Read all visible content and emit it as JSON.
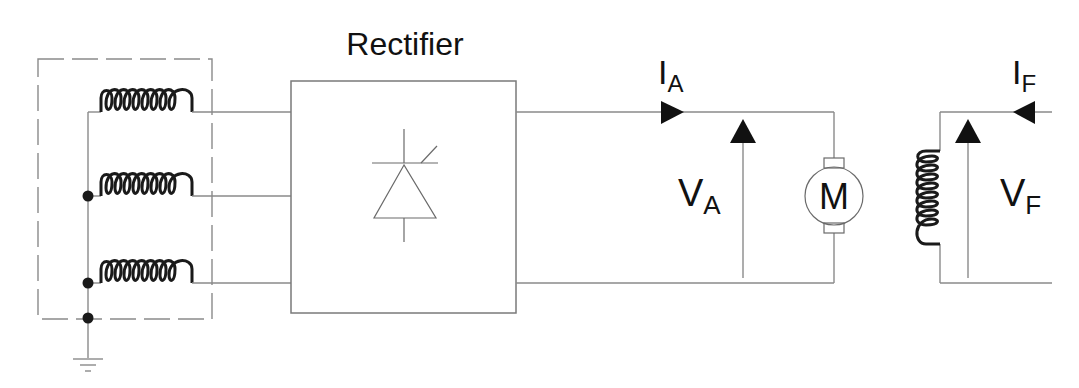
{
  "diagram": {
    "title": "Rectifier",
    "blocks": {
      "rectifier": {
        "label": "Rectifier",
        "symbol": "thyristor"
      },
      "motor": {
        "label": "M"
      }
    },
    "labels": {
      "armature_current": {
        "main": "I",
        "sub": "A"
      },
      "armature_voltage": {
        "main": "V",
        "sub": "A"
      },
      "field_current": {
        "main": "I",
        "sub": "F"
      },
      "field_voltage": {
        "main": "V",
        "sub": "F"
      }
    },
    "components": [
      {
        "id": "source-winding-1",
        "type": "inductor"
      },
      {
        "id": "source-winding-2",
        "type": "inductor"
      },
      {
        "id": "source-winding-3",
        "type": "inductor"
      },
      {
        "id": "rectifier",
        "type": "thyristor-bridge"
      },
      {
        "id": "dc-motor",
        "type": "motor"
      },
      {
        "id": "field-winding",
        "type": "inductor"
      },
      {
        "id": "ground",
        "type": "ground"
      }
    ],
    "colors": {
      "wire": "#8a8a8a",
      "coil": "#1a1a1a",
      "arrow": "#111111",
      "background": "#ffffff"
    }
  }
}
